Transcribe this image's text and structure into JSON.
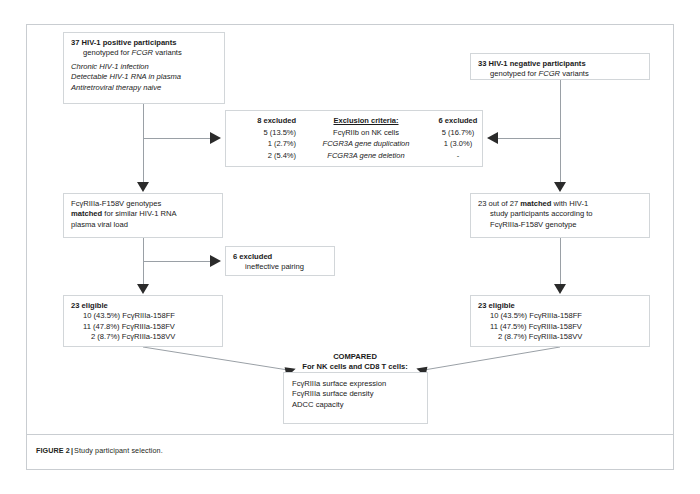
{
  "figure": {
    "label": "FIGURE 2",
    "separator": "|",
    "caption": "Study participant selection."
  },
  "colors": {
    "text": "#1a1a1a",
    "line": "#9aa0a6",
    "box_border": "#d2d6d9",
    "panel_border": "#c9cdd1",
    "arrow": "#2b2b2b"
  },
  "nodes": {
    "positive_cohort": {
      "title": "37 HIV-1 positive participants",
      "subtitle": "genotyped for FCGR variants",
      "criteria": [
        "Chronic HIV-1 infection",
        "Detectable HIV-1 RNA in plasma",
        "Antiretroviral therapy naive"
      ]
    },
    "negative_cohort": {
      "title": "33 HIV-1 negative participants",
      "subtitle": "genotyped for FCGR variants"
    },
    "exclusion": {
      "left_header": "8 excluded",
      "middle_header": "Exclusion criteria:",
      "right_header": "6 excluded",
      "rows": [
        {
          "left": "5 (13.5%)",
          "criterion": "FcγRIIb on NK cells",
          "criterion_italic": "",
          "right": "5 (16.7%)"
        },
        {
          "left": "1 (2.7%)",
          "criterion": "",
          "criterion_italic": "FCGR3A gene duplication",
          "right": "1 (3.0%)"
        },
        {
          "left": "2 (5.4%)",
          "criterion": "",
          "criterion_italic": "FCGR3A gene deletion",
          "right": "-"
        }
      ]
    },
    "matched_left": {
      "line1": "FcγRIIIa-F158V genotypes",
      "line2_bold": "matched",
      "line2_rest": " for similar HIV-1 RNA",
      "line3": "plasma viral load"
    },
    "matched_right": {
      "line1_pre": "23 out of 27 ",
      "line1_bold": "matched",
      "line1_post": " with HIV-1",
      "line2": "study participants according to",
      "line3": "FcγRIIIa-F158V genotype"
    },
    "ineffective": {
      "header": "6 excluded",
      "detail": "ineffective pairing"
    },
    "eligible_left": {
      "header": "23 eligible",
      "items": [
        "10 (43.5%) FcγRIIIa-158FF",
        "11 (47.8%) FcγRIIIa-158FV",
        "2 (8.7%) FcγRIIIa-158VV"
      ]
    },
    "eligible_right": {
      "header": "23 eligible",
      "items": [
        "10 (43.5%) FcγRIIIa-158FF",
        "11 (47.5%) FcγRIIIa-158FV",
        "2 (8.7%) FcγRIIIa-158VV"
      ]
    },
    "compared": {
      "title_line1": "COMPARED",
      "title_line2": "For NK cells and CD8 T cells:",
      "items": [
        "FcγRIIIa surface expression",
        "FcγRIIIa surface density",
        "ADCC capacity"
      ]
    }
  },
  "connectors": {
    "arrow_right_to_exclusion_left": "arrow-right-icon",
    "arrow_left_to_exclusion_right": "arrow-left-icon",
    "arrow_down_to_matched_left": "arrow-down-icon",
    "arrow_down_to_matched_right": "arrow-down-icon",
    "arrow_right_to_ineffective": "arrow-right-icon",
    "arrow_down_to_eligible_left": "arrow-down-icon",
    "arrow_down_to_eligible_right": "arrow-down-icon",
    "arrow_diag_left_to_compared": "arrow-up-icon",
    "arrow_diag_right_to_compared": "arrow-up-icon"
  }
}
